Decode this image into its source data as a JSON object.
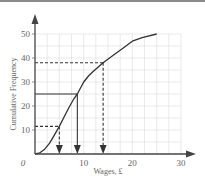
{
  "chart_data": {
    "type": "line",
    "title": "",
    "xlabel": "Wages, £",
    "ylabel": "Cumulative Frequency",
    "origin_label": "0",
    "xlim": [
      0,
      30
    ],
    "ylim": [
      0,
      50
    ],
    "x_ticks": [
      10,
      20,
      30
    ],
    "y_ticks": [
      10,
      20,
      30,
      40,
      50
    ],
    "grid": true,
    "series": [
      {
        "name": "Cumulative frequency curve",
        "x": [
          0,
          1,
          2,
          3,
          4,
          5,
          6,
          7,
          8,
          8.7,
          10,
          11,
          12,
          14,
          16,
          18,
          20,
          22,
          25
        ],
        "y": [
          0,
          0.5,
          2,
          4.5,
          8,
          11.5,
          15.5,
          19.5,
          23,
          25,
          30,
          32.5,
          34.5,
          38,
          41,
          44,
          47,
          48.5,
          50
        ]
      }
    ],
    "annotations": [
      {
        "label": "lower quartile reading",
        "cf": 11.5,
        "wage": 5,
        "style": "dashed"
      },
      {
        "label": "median reading",
        "cf": 25,
        "wage": 8.7,
        "style": "solid"
      },
      {
        "label": "upper quartile reading",
        "cf": 38,
        "wage": 14,
        "style": "dashed"
      }
    ]
  }
}
